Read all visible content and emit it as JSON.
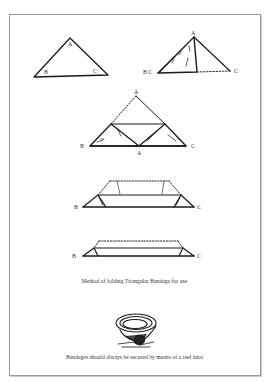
{
  "page": {
    "figures": [
      {
        "id": "step1",
        "labels": {
          "apex": "A",
          "left": "B",
          "right": "C"
        }
      },
      {
        "id": "step2",
        "labels": {
          "apex": "A",
          "left": "B C",
          "right": "C"
        }
      },
      {
        "id": "step3",
        "labels": {
          "apex": "A",
          "left": "B",
          "right": "C",
          "bottom": "A"
        }
      },
      {
        "id": "step4",
        "labels": {
          "left": "B",
          "right": "C"
        }
      },
      {
        "id": "step5",
        "labels": {
          "left": "B",
          "right": "C"
        }
      }
    ],
    "caption_folding": "Method of folding Triangular Bandage for use",
    "caption_knot": "Bandages should always be secured by means of a reef knot"
  }
}
